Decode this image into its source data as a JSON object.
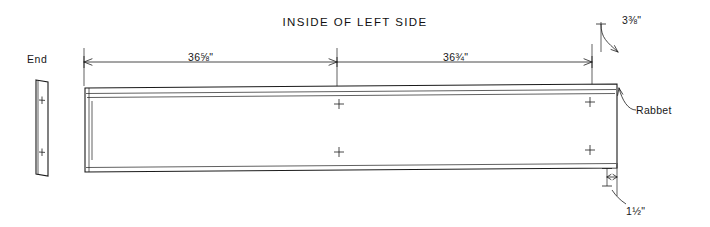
{
  "title": "INSIDE OF LEFT SIDE",
  "labels": {
    "end": "End",
    "rabbet": "Rabbet"
  },
  "dimensions": [
    {
      "name": "left-span",
      "value": "36⅝\""
    },
    {
      "name": "right-span",
      "value": "36¾\""
    },
    {
      "name": "top-right-offset",
      "value": "3⅜\""
    },
    {
      "name": "bottom-right-offset",
      "value": "1½\""
    }
  ],
  "drawing": {
    "type": "technical-line-drawing",
    "description": "Elevation of a long board (inside of left side panel) with dimension lines above and offsets at the right end, plus a narrow end-view profile at far left."
  }
}
